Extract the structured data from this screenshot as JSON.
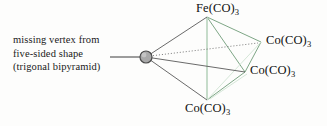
{
  "figure": {
    "type": "chemical-structure-diagram",
    "colors": {
      "edge_dark": "#595959",
      "edge_green": "#6f9c78",
      "edge_green_light": "#b8d4bd",
      "node_fill": "#a9a9a9",
      "node_stroke": "#4a4a4a",
      "text": "#101010",
      "background": "#fdfdfc"
    }
  },
  "annotation": {
    "line1": "missing vertex from",
    "line2": "five-sided shape",
    "line3": "(trigonal bipyramid)"
  },
  "vertices": [
    {
      "id": "fe-top",
      "metal": "Fe",
      "ligand": "(CO)",
      "count": "3",
      "x": 207,
      "y": 17
    },
    {
      "id": "co-right",
      "metal": "Co",
      "ligand": "(CO)",
      "count": "3",
      "x": 261,
      "y": 42
    },
    {
      "id": "co-mid",
      "metal": "Co",
      "ligand": "(CO)",
      "count": "3",
      "x": 245,
      "y": 72
    },
    {
      "id": "co-bottom",
      "metal": "Co",
      "ligand": "(CO)",
      "count": "3",
      "x": 207,
      "y": 100
    }
  ],
  "labels": {
    "fe_top": "Fe(CO)",
    "fe_top_sub": "3",
    "co_right": "Co(CO)",
    "co_right_sub": "3",
    "co_mid": "Co(CO)",
    "co_mid_sub": "3",
    "co_bottom": "Co(CO)",
    "co_bottom_sub": "3"
  },
  "open_vertex": {
    "name": "missing-vertex-node",
    "x": 146,
    "y": 57,
    "radius": 6
  },
  "leader_line": {
    "x1": 110,
    "y1": 57,
    "x2": 140,
    "y2": 57
  }
}
